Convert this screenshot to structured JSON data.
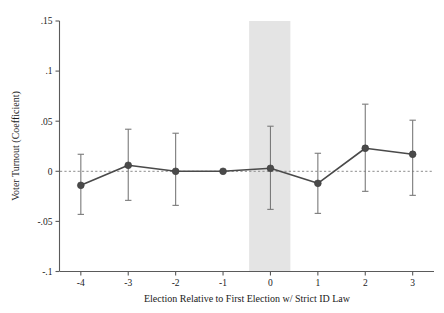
{
  "chart_data": {
    "type": "line",
    "title": "",
    "subtitle": "",
    "xlabel": "Election Relative to First Election w/ Strict ID Law",
    "ylabel": "Voter Turnout (Coefficient)",
    "x": [
      -4,
      -3,
      -2,
      -1,
      0,
      1,
      2,
      3
    ],
    "xtick_labels": [
      "-4",
      "-3",
      "-2",
      "-1",
      "0",
      "1",
      "2",
      "3"
    ],
    "ytick_labels": [
      ".15",
      ".1",
      ".05",
      "0",
      "-.05",
      "-.1"
    ],
    "ytick_values": [
      0.15,
      0.1,
      0.05,
      0,
      -0.05,
      -0.1
    ],
    "xlim": [
      -4.45,
      3.45
    ],
    "ylim": [
      -0.1,
      0.15
    ],
    "grid": false,
    "legend": "none",
    "series": [
      {
        "name": "Voter Turnout (Coefficient)",
        "values": [
          -0.014,
          0.006,
          0.0,
          0.0,
          0.003,
          -0.012,
          0.023,
          0.017
        ],
        "ci_low": [
          -0.043,
          -0.029,
          -0.034,
          0.0,
          -0.038,
          -0.042,
          -0.02,
          -0.024
        ],
        "ci_high": [
          0.017,
          0.042,
          0.038,
          0.0,
          0.045,
          0.018,
          0.067,
          0.051
        ],
        "marker": "filled-circle",
        "color": "#4a4a4a",
        "errorbar_color": "#7a7a7a"
      }
    ],
    "annotations": [
      {
        "name": "reference-zero-line",
        "type": "hline",
        "value": 0,
        "style": "dashed",
        "color": "#8c8c8c"
      },
      {
        "name": "treatment-period-band",
        "type": "vband",
        "x_from": -0.45,
        "x_to": 0.42,
        "color": "#e4e4e4"
      }
    ]
  }
}
